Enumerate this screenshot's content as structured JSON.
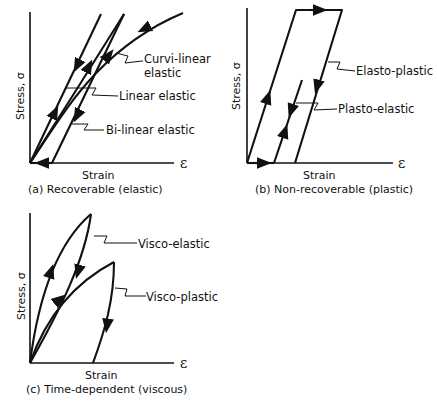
{
  "figure": {
    "panels": [
      {
        "id": "a",
        "caption": "(a) Recoverable (elastic)",
        "xlabel": "Strain",
        "ylabel": "Stress, σ",
        "x_symbol": "ε",
        "labels": [
          "Curvi-linear",
          "elastic",
          "Linear elastic",
          "Bi-linear elastic"
        ]
      },
      {
        "id": "b",
        "caption": "(b) Non-recoverable (plastic)",
        "xlabel": "Strain",
        "ylabel": "Stress, σ",
        "x_symbol": "ε",
        "labels": [
          "Elasto-plastic",
          "Plasto-elastic"
        ]
      },
      {
        "id": "c",
        "caption": "(c) Time-dependent (viscous)",
        "xlabel": "Strain",
        "ylabel": "Stress, σ",
        "x_symbol": "ε",
        "labels": [
          "Visco-elastic",
          "Visco-plastic"
        ]
      }
    ]
  }
}
